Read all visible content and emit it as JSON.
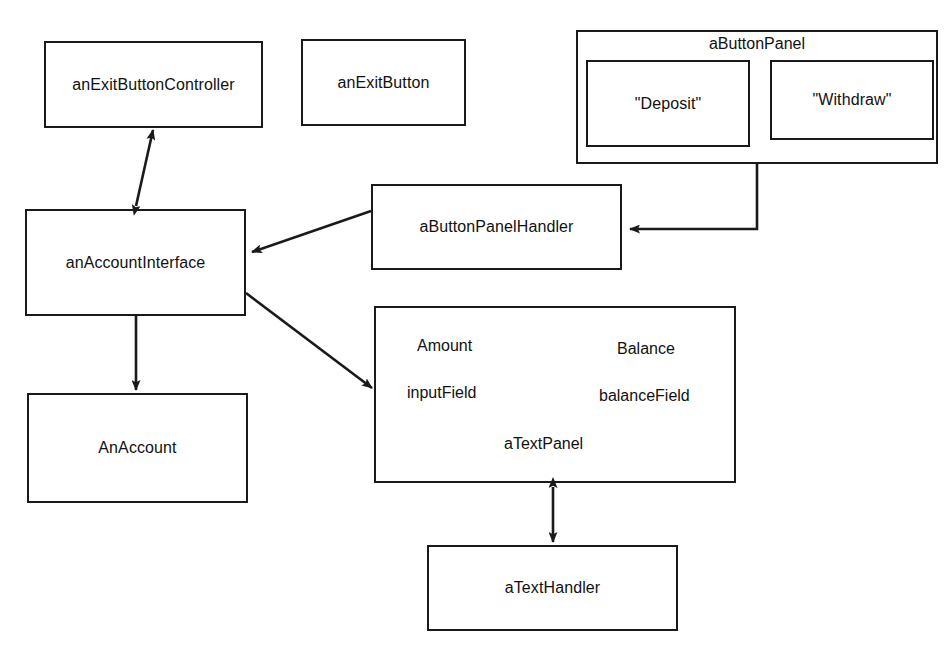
{
  "diagram": {
    "stroke_color": "#1a1a1a",
    "background_color": "#ffffff",
    "nodes": {
      "exit_button_controller": {
        "label": "anExitButtonController"
      },
      "exit_button": {
        "label": "anExitButton"
      },
      "button_panel": {
        "label": "aButtonPanel"
      },
      "deposit_button": {
        "label": "\"Deposit\""
      },
      "withdraw_button": {
        "label": "\"Withdraw\""
      },
      "button_panel_handler": {
        "label": "aButtonPanelHandler"
      },
      "account_interface": {
        "label": "anAccountInterface"
      },
      "an_account": {
        "label": "AnAccount"
      },
      "text_panel": {
        "label": "aTextPanel",
        "amount_label": "Amount",
        "balance_label": "Balance",
        "input_field_label": "inputField",
        "balance_field_label": "balanceField"
      },
      "text_handler": {
        "label": "aTextHandler"
      }
    },
    "edges": [
      {
        "from": "anAccountInterface",
        "to": "anExitButtonController",
        "style": "double-arrow"
      },
      {
        "from": "aButtonPanel",
        "to": "aButtonPanelHandler",
        "style": "arrow"
      },
      {
        "from": "aButtonPanelHandler",
        "to": "anAccountInterface",
        "style": "arrow"
      },
      {
        "from": "anAccountInterface",
        "to": "AnAccount",
        "style": "arrow"
      },
      {
        "from": "anAccountInterface",
        "to": "aTextPanel",
        "style": "arrow"
      },
      {
        "from": "aTextPanel",
        "to": "aTextHandler",
        "style": "double-arrow"
      }
    ]
  }
}
